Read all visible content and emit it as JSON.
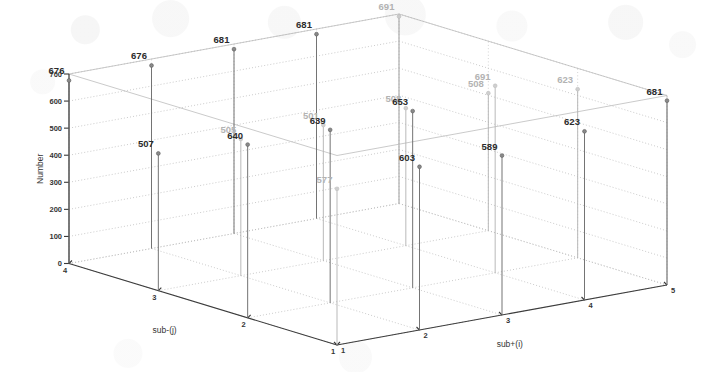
{
  "figure": {
    "kind": "3d-stem-plot",
    "background": "#ffffff",
    "stem_color": "#6d6d6d",
    "marker_color": "#8a8a8a",
    "label_color": "#2b2b2b",
    "faded_label_color": "#b3b3b3",
    "grid_color": "#b9b9b9",
    "axis_color": "#3b3b3b"
  },
  "axes": {
    "z": {
      "title": "Number",
      "ticks": [
        "0",
        "100",
        "200",
        "300",
        "400",
        "500",
        "600",
        "700"
      ],
      "min": 0,
      "max": 700,
      "step": 100
    },
    "left": {
      "title": "sub-(j)",
      "ticks": [
        "4",
        "3",
        "2",
        "1"
      ],
      "values": [
        4,
        3,
        2,
        1
      ]
    },
    "right": {
      "title": "sub+(i)",
      "ticks": [
        "1",
        "2",
        "3",
        "4",
        "5"
      ],
      "values": [
        1,
        2,
        3,
        4,
        5
      ]
    }
  },
  "chart_data": {
    "type": "scatter",
    "title": "",
    "xlabel": "sub-(j)",
    "ylabel": "sub+(i)",
    "zlabel": "Number",
    "zlim": [
      0,
      700
    ],
    "grid": true,
    "legend": null,
    "points": [
      {
        "j": 4,
        "i": 1,
        "value": 676,
        "label": "676",
        "faded": false
      },
      {
        "j": 3,
        "i": 1,
        "value": 507,
        "label": "507",
        "faded": false
      },
      {
        "j": 2,
        "i": 1,
        "value": 640,
        "label": "640",
        "faded": false
      },
      {
        "j": 1,
        "i": 1,
        "value": 577,
        "label": "577",
        "faded": true
      },
      {
        "j": 4,
        "i": 2,
        "value": 676,
        "label": "676",
        "faded": false
      },
      {
        "j": 3,
        "i": 2,
        "value": 505,
        "label": "505",
        "faded": true
      },
      {
        "j": 2,
        "i": 2,
        "value": 639,
        "label": "639",
        "faded": false
      },
      {
        "j": 1,
        "i": 2,
        "value": 603,
        "label": "603",
        "faded": false
      },
      {
        "j": 4,
        "i": 3,
        "value": 681,
        "label": "681",
        "faded": false
      },
      {
        "j": 3,
        "i": 3,
        "value": 501,
        "label": "501",
        "faded": true
      },
      {
        "j": 2,
        "i": 3,
        "value": 653,
        "label": "653",
        "faded": false
      },
      {
        "j": 1,
        "i": 3,
        "value": 589,
        "label": "589",
        "faded": false
      },
      {
        "j": 4,
        "i": 4,
        "value": 681,
        "label": "681",
        "faded": false
      },
      {
        "j": 3,
        "i": 4,
        "value": 508,
        "label": "508",
        "faded": true
      },
      {
        "j": 2,
        "i": 4,
        "value": 691,
        "label": "691",
        "faded": true
      },
      {
        "j": 1,
        "i": 4,
        "value": 623,
        "label": "623",
        "faded": false
      },
      {
        "j": 4,
        "i": 5,
        "value": 691,
        "label": "691",
        "faded": true
      },
      {
        "j": 3,
        "i": 5,
        "value": 508,
        "label": "508",
        "faded": true
      },
      {
        "j": 2,
        "i": 5,
        "value": 623,
        "label": "623",
        "faded": true
      },
      {
        "j": 1,
        "i": 5,
        "value": 681,
        "label": "681",
        "faded": false
      }
    ],
    "value_labels": [
      "676",
      "507",
      "640",
      "577",
      "676",
      "505",
      "639",
      "603",
      "681",
      "501",
      "653",
      "589",
      "681",
      "508",
      "691",
      "623",
      "691",
      "508",
      "623",
      "681"
    ]
  }
}
